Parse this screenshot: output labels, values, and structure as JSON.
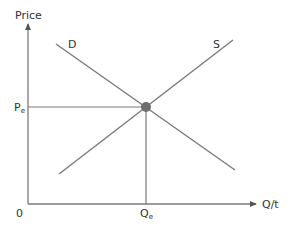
{
  "diagram": {
    "type": "supply-demand",
    "axes": {
      "y_label": "Price",
      "x_label": "Q/t",
      "origin_label": "0"
    },
    "curves": {
      "demand": {
        "label": "D"
      },
      "supply": {
        "label": "S"
      }
    },
    "equilibrium": {
      "price_label_main": "P",
      "price_label_sub": "e",
      "quantity_label_main": "Q",
      "quantity_label_sub": "e"
    },
    "colors": {
      "axis": "#7a7a7a",
      "curve": "#7a7a7a",
      "point": "#6e6e6e",
      "text": "#333333"
    }
  }
}
